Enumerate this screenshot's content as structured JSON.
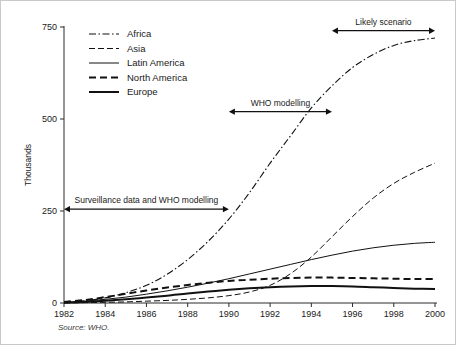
{
  "figure": {
    "source_note": "Source: WHO.",
    "background_color": "#ffffff",
    "line_color": "#111111"
  },
  "chart_data": {
    "type": "line",
    "title": "",
    "xlabel": "",
    "ylabel": "Thousands",
    "xlim": [
      1982,
      2000
    ],
    "ylim": [
      0,
      750
    ],
    "xticks": [
      1982,
      1984,
      1986,
      1988,
      1990,
      1992,
      1994,
      1996,
      1998,
      2000
    ],
    "xtick_labels": [
      "1982",
      "1984",
      "1986",
      "1988",
      "1990",
      "1992",
      "1994",
      "1996",
      "1998",
      "2000"
    ],
    "yticks": [
      0,
      250,
      500,
      750
    ],
    "ytick_labels": [
      "0",
      "250",
      "500",
      "750"
    ],
    "grid": false,
    "legend_position": "top-left",
    "x": [
      1982,
      1983,
      1984,
      1985,
      1986,
      1987,
      1988,
      1989,
      1990,
      1991,
      1992,
      1993,
      1994,
      1995,
      1996,
      1997,
      1998,
      1999,
      2000
    ],
    "series": [
      {
        "name": "Africa",
        "style": "dashdot",
        "width": 1.1,
        "values": [
          2,
          6,
          14,
          28,
          48,
          78,
          118,
          168,
          228,
          300,
          380,
          455,
          530,
          590,
          640,
          675,
          700,
          713,
          720
        ]
      },
      {
        "name": "Asia",
        "style": "dashed-thin",
        "width": 1.0,
        "values": [
          0,
          1,
          2,
          3,
          5,
          7,
          10,
          14,
          20,
          30,
          48,
          80,
          125,
          180,
          235,
          285,
          325,
          355,
          380
        ]
      },
      {
        "name": "Latin America",
        "style": "solid-thin",
        "width": 1.0,
        "values": [
          2,
          5,
          10,
          16,
          24,
          33,
          43,
          54,
          66,
          79,
          92,
          105,
          118,
          130,
          141,
          150,
          157,
          162,
          165
        ]
      },
      {
        "name": "North America",
        "style": "dashed-bold",
        "width": 2.0,
        "values": [
          3,
          8,
          16,
          25,
          34,
          42,
          49,
          55,
          60,
          63,
          66,
          68,
          69,
          69,
          68,
          67,
          66,
          65,
          65
        ]
      },
      {
        "name": "Europe",
        "style": "solid-bold",
        "width": 2.0,
        "values": [
          1,
          3,
          6,
          10,
          15,
          20,
          26,
          31,
          36,
          40,
          43,
          45,
          46,
          46,
          45,
          43,
          41,
          39,
          38
        ]
      }
    ],
    "annotations": [
      {
        "label": "Surveillance data and WHO modelling",
        "x_start": 1982,
        "x_end": 1990,
        "y": 255
      },
      {
        "label": "WHO modelling",
        "x_start": 1990,
        "x_end": 1995,
        "y": 520
      },
      {
        "label": "Likely scenario",
        "x_start": 1995,
        "x_end": 2000,
        "y": 740
      }
    ]
  }
}
